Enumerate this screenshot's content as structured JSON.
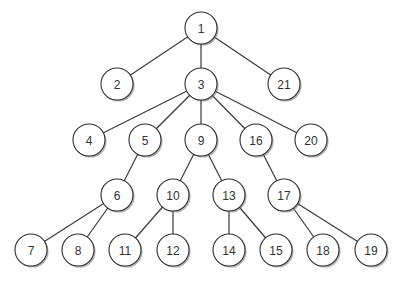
{
  "diagram": {
    "type": "tree",
    "node_radius": 16,
    "colors": {
      "edge": "#3a3a3a",
      "node_fill": "#ffffff",
      "node_stroke": "#2f2f2f",
      "label": "#333333"
    },
    "nodes": [
      {
        "id": "1",
        "label": "1",
        "x": 201,
        "y": 28
      },
      {
        "id": "2",
        "label": "2",
        "x": 117,
        "y": 84
      },
      {
        "id": "3",
        "label": "3",
        "x": 201,
        "y": 84
      },
      {
        "id": "21",
        "label": "21",
        "x": 284,
        "y": 84
      },
      {
        "id": "4",
        "label": "4",
        "x": 89,
        "y": 140
      },
      {
        "id": "5",
        "label": "5",
        "x": 145,
        "y": 140
      },
      {
        "id": "9",
        "label": "9",
        "x": 201,
        "y": 140
      },
      {
        "id": "16",
        "label": "16",
        "x": 256,
        "y": 140
      },
      {
        "id": "20",
        "label": "20",
        "x": 311,
        "y": 140
      },
      {
        "id": "6",
        "label": "6",
        "x": 117,
        "y": 195
      },
      {
        "id": "10",
        "label": "10",
        "x": 173,
        "y": 195
      },
      {
        "id": "13",
        "label": "13",
        "x": 229,
        "y": 195
      },
      {
        "id": "17",
        "label": "17",
        "x": 284,
        "y": 195
      },
      {
        "id": "7",
        "label": "7",
        "x": 31,
        "y": 250
      },
      {
        "id": "8",
        "label": "8",
        "x": 78,
        "y": 250
      },
      {
        "id": "11",
        "label": "11",
        "x": 125,
        "y": 250
      },
      {
        "id": "12",
        "label": "12",
        "x": 173,
        "y": 250
      },
      {
        "id": "14",
        "label": "14",
        "x": 229,
        "y": 250
      },
      {
        "id": "15",
        "label": "15",
        "x": 276,
        "y": 250
      },
      {
        "id": "18",
        "label": "18",
        "x": 323,
        "y": 250
      },
      {
        "id": "19",
        "label": "19",
        "x": 371,
        "y": 250
      }
    ],
    "edges": [
      [
        "1",
        "2"
      ],
      [
        "1",
        "3"
      ],
      [
        "1",
        "21"
      ],
      [
        "3",
        "4"
      ],
      [
        "3",
        "5"
      ],
      [
        "3",
        "9"
      ],
      [
        "3",
        "16"
      ],
      [
        "3",
        "20"
      ],
      [
        "5",
        "6"
      ],
      [
        "6",
        "7"
      ],
      [
        "6",
        "8"
      ],
      [
        "9",
        "10"
      ],
      [
        "9",
        "13"
      ],
      [
        "10",
        "11"
      ],
      [
        "10",
        "12"
      ],
      [
        "13",
        "14"
      ],
      [
        "13",
        "15"
      ],
      [
        "16",
        "17"
      ],
      [
        "17",
        "18"
      ],
      [
        "17",
        "19"
      ]
    ]
  },
  "caption": {
    "text": ""
  }
}
